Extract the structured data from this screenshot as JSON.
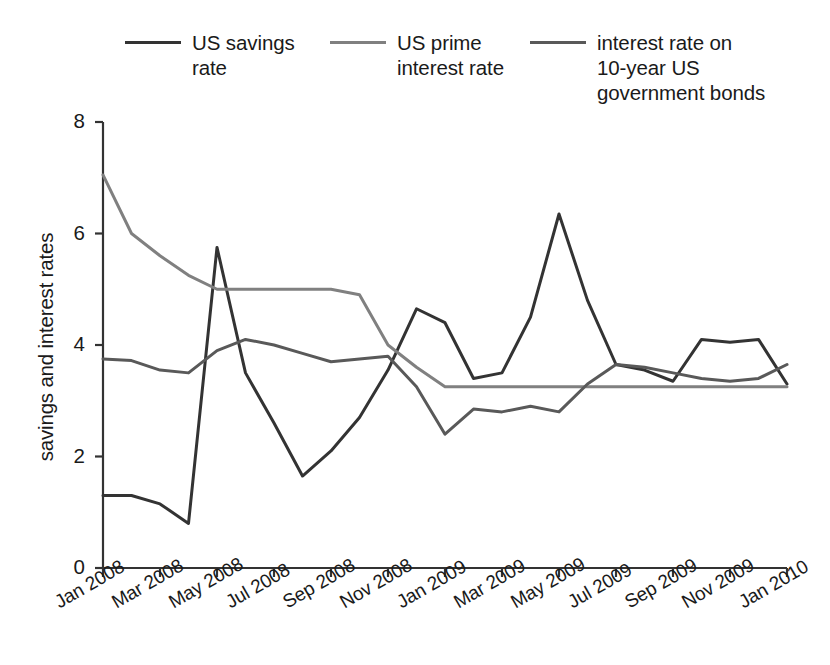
{
  "chart_data": {
    "type": "line",
    "title": "",
    "xlabel": "",
    "ylabel": "savings and interest rates",
    "ylim": [
      0,
      8
    ],
    "yticks": [
      0,
      2,
      4,
      6,
      8
    ],
    "grid": false,
    "legend_position": "top",
    "x": [
      "Jan 2008",
      "Feb 2008",
      "Mar 2008",
      "Apr 2008",
      "May 2008",
      "Jun 2008",
      "Jul 2008",
      "Aug 2008",
      "Sep 2008",
      "Oct 2008",
      "Nov 2008",
      "Dec 2008",
      "Jan 2009",
      "Feb 2009",
      "Mar 2009",
      "Apr 2009",
      "May 2009",
      "Jun 2009",
      "Jul 2009",
      "Aug 2009",
      "Sep 2009",
      "Oct 2009",
      "Nov 2009",
      "Dec 2009",
      "Jan 2010"
    ],
    "xtick_labels": [
      "Jan 2008",
      "Mar 2008",
      "May 2008",
      "Jul 2008",
      "Sep 2008",
      "Nov 2008",
      "Jan 2009",
      "Mar 2009",
      "May 2009",
      "Jul 2009",
      "Sep 2009",
      "Nov 2009",
      "Jan 2010"
    ],
    "series": [
      {
        "name": "US savings\nrate",
        "legend_label": "US savings\nrate",
        "color": "#333333",
        "values": [
          1.3,
          1.3,
          1.15,
          0.8,
          5.75,
          3.5,
          2.6,
          1.65,
          2.1,
          2.7,
          3.55,
          4.65,
          4.4,
          3.4,
          3.5,
          4.5,
          6.35,
          4.8,
          3.65,
          3.55,
          3.35,
          4.1,
          4.05,
          4.1,
          3.3
        ]
      },
      {
        "name": "US prime\ninterest rate",
        "legend_label": "US prime\ninterest rate",
        "color": "#808080",
        "values": [
          7.05,
          6.0,
          5.6,
          5.25,
          5.0,
          5.0,
          5.0,
          5.0,
          5.0,
          4.9,
          4.0,
          3.6,
          3.25,
          3.25,
          3.25,
          3.25,
          3.25,
          3.25,
          3.25,
          3.25,
          3.25,
          3.25,
          3.25,
          3.25,
          3.25
        ]
      },
      {
        "name": "interest rate on\n10-year US\ngovernment bonds",
        "legend_label": "interest rate on\n10-year US\ngovernment bonds",
        "color": "#595959",
        "values": [
          3.75,
          3.72,
          3.55,
          3.5,
          3.9,
          4.1,
          4.0,
          3.85,
          3.7,
          3.75,
          3.8,
          3.25,
          2.4,
          2.85,
          2.8,
          2.9,
          2.8,
          3.3,
          3.65,
          3.6,
          3.5,
          3.4,
          3.35,
          3.4,
          3.65
        ]
      }
    ]
  },
  "axis": {
    "y_title": "savings and interest rates"
  }
}
